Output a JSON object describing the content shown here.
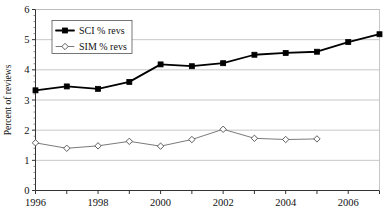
{
  "chart_data": {
    "type": "line",
    "title": "",
    "xlabel": "",
    "ylabel": "Percent of reviews",
    "xlim": [
      1996,
      2007
    ],
    "ylim": [
      0,
      6
    ],
    "y_ticks": [
      0,
      1,
      2,
      3,
      4,
      5,
      6
    ],
    "y_tick_labels": [
      "0",
      "1",
      "2",
      "3",
      "4",
      "5",
      "6"
    ],
    "y_minor_tick_step": 0.2,
    "x_ticks": [
      1996,
      1997,
      1998,
      1999,
      2000,
      2001,
      2002,
      2003,
      2004,
      2005,
      2006,
      2007
    ],
    "x_tick_labels_shown": [
      "1996",
      "1998",
      "2000",
      "2002",
      "2004",
      "2006"
    ],
    "x_labeled_years": [
      1996,
      1998,
      2000,
      2002,
      2004,
      2006
    ],
    "grid": "horizontal",
    "legend_position": "top-left-inside",
    "series": [
      {
        "name": "SCI % revs",
        "marker": "filled-square",
        "color": "#000000",
        "x": [
          1996,
          1997,
          1998,
          1999,
          2000,
          2001,
          2002,
          2003,
          2004,
          2005,
          2006,
          2007
        ],
        "values": [
          3.32,
          3.45,
          3.37,
          3.6,
          4.18,
          4.12,
          4.22,
          4.5,
          4.56,
          4.6,
          4.92,
          5.18
        ]
      },
      {
        "name": "SIM % revs",
        "marker": "open-diamond",
        "color": "#6b6b6b",
        "x": [
          1996,
          1997,
          1998,
          1999,
          2000,
          2001,
          2002,
          2003,
          2004,
          2005
        ],
        "values": [
          1.58,
          1.4,
          1.48,
          1.63,
          1.47,
          1.69,
          2.03,
          1.73,
          1.69,
          1.71
        ]
      }
    ]
  },
  "legend": {
    "items": [
      {
        "label": "SCI % revs"
      },
      {
        "label": "SIM % revs"
      }
    ]
  },
  "axes": {
    "y_title": "Percent of reviews"
  }
}
